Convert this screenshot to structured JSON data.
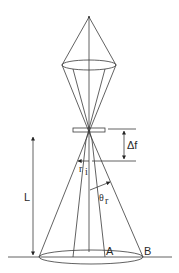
{
  "diagram": {
    "type": "optical-cone-geometry",
    "labels": {
      "length": "L",
      "defocus": "Δf",
      "radius_main": "r",
      "radius_sub": "i",
      "angle_main": "θ",
      "angle_sub": "r",
      "point_a": "A",
      "point_b": "B"
    },
    "colors": {
      "line": "#3a3a3a",
      "text": "#2a2a2a",
      "background": "#ffffff"
    }
  }
}
